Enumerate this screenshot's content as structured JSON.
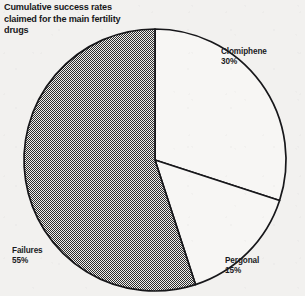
{
  "figure": {
    "title_lines": [
      "Cumulative success rates",
      "claimed for the main fertility",
      "drugs"
    ],
    "background_color": "#f2f1ef",
    "ink_color": "#17171a"
  },
  "labels": {
    "clomiphene_name": "Clomiphene",
    "clomiphene_value": "30%",
    "pergonal_name": "Pergonal",
    "pergonal_value": "15%",
    "failures_name": "Failures",
    "failures_value": "55%"
  },
  "chart_data": {
    "type": "pie",
    "title": "Cumulative success rates claimed for the main fertility drugs",
    "subtitle": "",
    "xlabel": "",
    "ylabel": "",
    "units": "percent",
    "total": 100,
    "start_angle_deg": 0,
    "direction": "clockwise",
    "legend_position": "outside-labels",
    "grid": false,
    "categories": [
      "Clomiphene",
      "Pergonal",
      "Failures"
    ],
    "values": [
      30,
      15,
      55
    ],
    "slices": [
      {
        "label": "Clomiphene",
        "value": 30,
        "display": "30%",
        "fill": "white",
        "fill_color": "#f7f6f4",
        "start_deg": 0,
        "end_deg": 108,
        "label_position": "upper-right"
      },
      {
        "label": "Pergonal",
        "value": 15,
        "display": "15%",
        "fill": "white",
        "fill_color": "#f7f6f4",
        "start_deg": 108,
        "end_deg": 162,
        "label_position": "lower-right"
      },
      {
        "label": "Failures",
        "value": 55,
        "display": "55%",
        "fill": "checkerboard-dither",
        "fill_color": "#3a3a3a",
        "start_deg": 162,
        "end_deg": 360,
        "label_position": "lower-left"
      }
    ]
  },
  "geometry": {
    "center_x": 155,
    "center_y": 160,
    "radius": 131,
    "stroke_width": 1.7
  }
}
